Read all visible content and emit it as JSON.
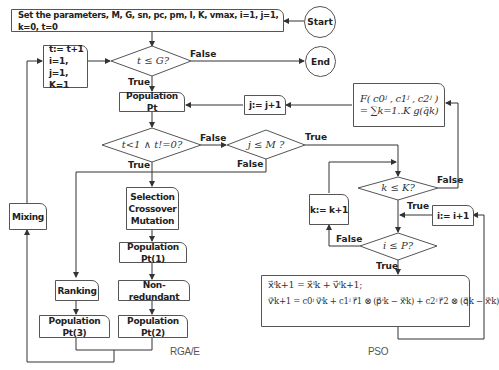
{
  "nodes": {
    "start": "Start",
    "end": "End",
    "init": "Set the parameters, M, G, sn, pc, pm, I, K, vmax, i=1, j=1, k=0, t=0",
    "update_t_l1": "t:= t+1",
    "update_t_l2": "i=1, j=1,",
    "update_t_l3": "K=1",
    "cond_t_le_G": "t ≤ G?",
    "population_pt": "Population Pt",
    "cond_t_lt_1": "t<1 ∧ t!=0?",
    "cond_j_le_M": "j ≤ M ?",
    "j_increment": "j:= j+1",
    "fitness_l1": "F( c0ʲ , c1ʲ , c2ʲ )",
    "fitness_l2": "= ∑k=1..K g(q̄k)",
    "cond_k_le_K": "k ≤ K?",
    "k_increment": "k:= k+1",
    "i_increment": "i:= i+1",
    "cond_i_le_P": "i ≤ P?",
    "pso_eq1": "x⃗ⁱk+1 = x⃗ⁱk + v⃗ⁱk+1;",
    "pso_eq2": "v⃗ⁱk+1 = c0ʲ v⃗ⁱk + c1ʲ r⃗1 ⊗ (p⃗ⁱk − x⃗ⁱk) + c2ʲ r⃗2 ⊗ (q⃗k − x⃗ⁱk)",
    "mixing": "Mixing",
    "selection_l1": "Selection",
    "selection_l2": "Crossover",
    "selection_l3": "Mutation",
    "population_pt1": "Population Pt(1)",
    "non_redundant": "Non-redundant",
    "ranking": "Ranking",
    "population_pt2": "Population Pt(2)",
    "population_pt3": "Population Pt(3)"
  },
  "edge_labels": {
    "true": "True",
    "false": "False"
  },
  "captions": {
    "rga": "RGA/E",
    "pso": "PSO"
  }
}
